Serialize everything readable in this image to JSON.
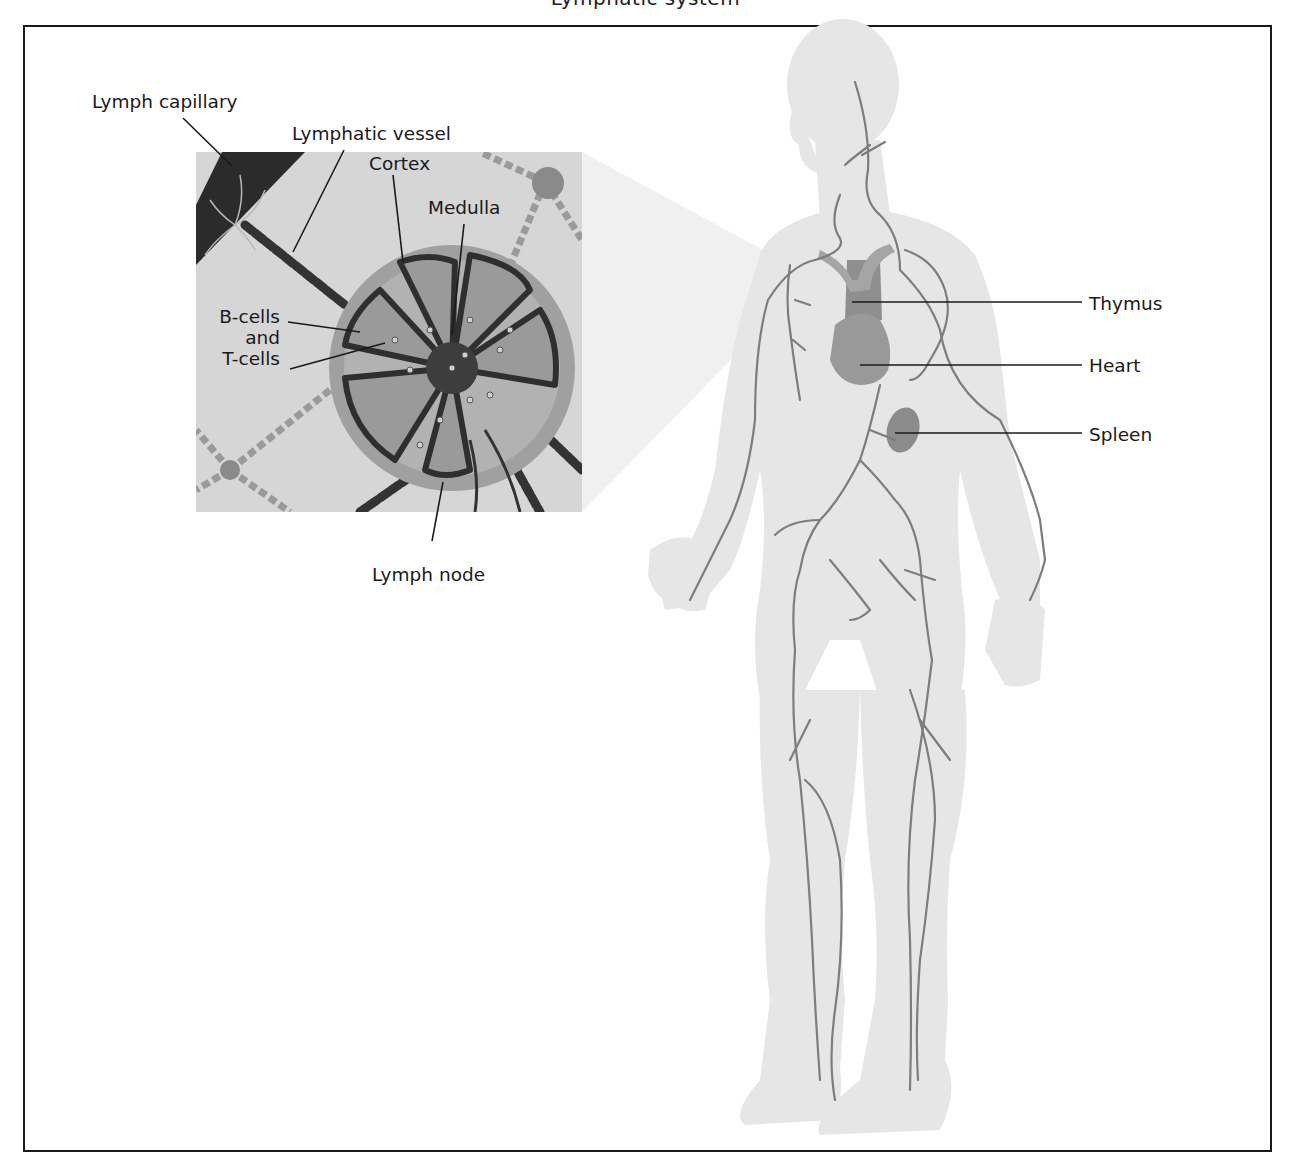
{
  "figure": {
    "title_cut_off": "Lymphatic system",
    "colors": {
      "frame": "#1a1a1a",
      "body_fill": "#e6e6e6",
      "vessel": "#7a7a7a",
      "organ": "#8c8c8c",
      "inset_bg": "#d9d9d9",
      "capillary_band": "#2b2b2b",
      "node_capsule": "#a3a3a3",
      "node_dark": "#3a3a3a",
      "label_text": "#1a1a1a"
    },
    "inset": {
      "labels": {
        "lymph_capillary": "Lymph capillary",
        "lymphatic_vessel": "Lymphatic vessel",
        "cortex": "Cortex",
        "medulla": "Medulla",
        "b_cells_line1": "B-cells",
        "b_cells_line2": "and",
        "b_cells_line3": "T-cells",
        "lymph_node": "Lymph node"
      }
    },
    "body": {
      "labels": {
        "thymus": "Thymus",
        "heart": "Heart",
        "spleen": "Spleen"
      }
    }
  }
}
